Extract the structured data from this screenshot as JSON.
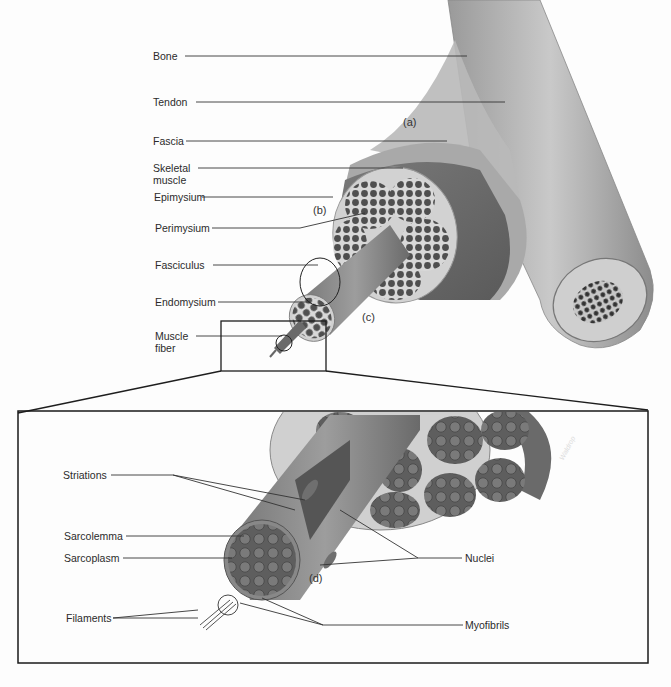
{
  "figure": {
    "colors": {
      "background": "#fdfdfd",
      "line": "#222222",
      "muscle_dark": "#5a5a5a",
      "muscle_mid": "#8a8a8a",
      "tissue_light": "#c9c9c9",
      "bone": "#b5b5b5"
    }
  },
  "top_panel": {
    "labels": [
      {
        "id": "bone",
        "text": "Bone"
      },
      {
        "id": "tendon",
        "text": "Tendon"
      },
      {
        "id": "fascia",
        "text": "Fascia"
      },
      {
        "id": "skeletal_muscle",
        "text": "Skeletal muscle"
      },
      {
        "id": "epimysium",
        "text": "Epimysium"
      },
      {
        "id": "perimysium",
        "text": "Perimysium"
      },
      {
        "id": "fasciculus",
        "text": "Fasciculus"
      },
      {
        "id": "endomysium",
        "text": "Endomysium"
      },
      {
        "id": "muscle_fiber",
        "text": "Muscle fiber"
      }
    ],
    "panel_tags": {
      "a": "(a)",
      "b": "(b)",
      "c": "(c)"
    }
  },
  "bottom_panel": {
    "left_labels": [
      {
        "id": "striations",
        "text": "Striations"
      },
      {
        "id": "sarcolemma",
        "text": "Sarcolemma"
      },
      {
        "id": "sarcoplasm",
        "text": "Sarcoplasm"
      },
      {
        "id": "filaments",
        "text": "Filaments"
      }
    ],
    "right_labels": [
      {
        "id": "nuclei",
        "text": "Nuclei"
      },
      {
        "id": "myofibrils",
        "text": "Myofibrils"
      }
    ],
    "panel_tags": {
      "d": "(d)"
    },
    "signature": "Waldrop"
  }
}
